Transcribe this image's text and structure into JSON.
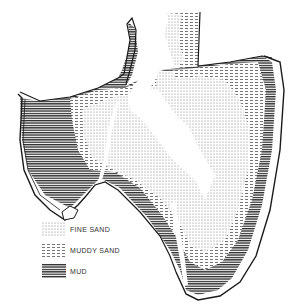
{
  "figure": {
    "type": "sediment-distribution-map",
    "colors": {
      "outline": "#1a1a1a",
      "fine_sand": "#b8b8b8",
      "muddy_sand": "#8a8a8a",
      "mud": "#3a3a3a",
      "channel": "#ffffff"
    }
  },
  "legend": {
    "items": [
      {
        "key": "fine_sand",
        "label": "FINE SAND",
        "pattern": "dots"
      },
      {
        "key": "muddy_sand",
        "label": "MUDDY SAND",
        "pattern": "dashes"
      },
      {
        "key": "mud",
        "label": "MUD",
        "pattern": "horizontal-lines"
      }
    ]
  }
}
